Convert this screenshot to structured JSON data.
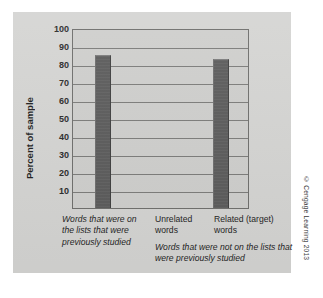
{
  "chart_data": {
    "type": "bar",
    "title": "",
    "xlabel": "",
    "ylabel": "Percent of sample",
    "ylim": [
      0,
      100
    ],
    "ytick_values": [
      10,
      20,
      30,
      40,
      50,
      60,
      70,
      80,
      90,
      100
    ],
    "ytick_labels": [
      "10",
      "20",
      "30",
      "40",
      "50",
      "60",
      "70",
      "80",
      "90",
      "100"
    ],
    "grid": true,
    "legend": "none",
    "categories": [
      "Words that were on the lists that were previously studied",
      "Unrelated words",
      "Related (target) words"
    ],
    "values": [
      85,
      0,
      83
    ],
    "annotations": [
      "Words that were not on the lists that were previously studied"
    ],
    "bar_color": "#5b5b5b",
    "plot_background": "#cfcfcd",
    "figure_background": "#d5d5d3"
  },
  "axis": {
    "y_title": "Percent of sample",
    "ticks": [
      {
        "label": "100",
        "value": 100
      },
      {
        "label": "90",
        "value": 90
      },
      {
        "label": "80",
        "value": 80
      },
      {
        "label": "70",
        "value": 70
      },
      {
        "label": "60",
        "value": 60
      },
      {
        "label": "50",
        "value": 50
      },
      {
        "label": "40",
        "value": 40
      },
      {
        "label": "30",
        "value": 30
      },
      {
        "label": "20",
        "value": 20
      },
      {
        "label": "10",
        "value": 10
      }
    ]
  },
  "categories": [
    {
      "id": "cat-0",
      "label": "Words that were on the lists that were previously studied",
      "style": "italic",
      "value": 85
    },
    {
      "id": "cat-1",
      "label": "Unrelated words",
      "style": "normal",
      "value": 0
    },
    {
      "id": "cat-2",
      "label": "Related (target) words",
      "style": "normal",
      "value": 83
    }
  ],
  "group_caption": "Words that were not on the lists that were previously studied",
  "credit": "© Cengage Learning 2013"
}
